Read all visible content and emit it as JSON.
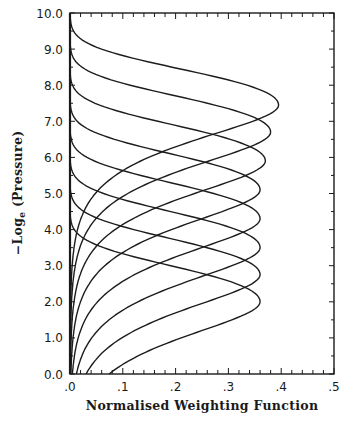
{
  "chart_data": {
    "type": "line",
    "title": "",
    "xlabel": "Normalised Weighting Function",
    "ylabel": "-Log_e (Pressure)",
    "ylabel_main": "−Log",
    "ylabel_sub": "e",
    "ylabel_rest": " (Pressure)",
    "xlim": [
      0.0,
      0.5
    ],
    "ylim": [
      0.0,
      10.0
    ],
    "x_ticks": [
      ".0",
      ".1",
      ".2",
      ".3",
      ".4",
      ".5"
    ],
    "y_ticks": [
      "0.0",
      "1.0",
      "2.0",
      "3.0",
      "4.0",
      "5.0",
      "6.0",
      "7.0",
      "8.0",
      "9.0",
      "10.0"
    ],
    "grid": false,
    "legend": null,
    "series": [
      {
        "name": "channel-1",
        "peak_y": 2.0,
        "peak_x": 0.36
      },
      {
        "name": "channel-2",
        "peak_y": 2.75,
        "peak_x": 0.36
      },
      {
        "name": "channel-3",
        "peak_y": 3.5,
        "peak_x": 0.36
      },
      {
        "name": "channel-4",
        "peak_y": 4.3,
        "peak_x": 0.36
      },
      {
        "name": "channel-5",
        "peak_y": 5.1,
        "peak_x": 0.36
      },
      {
        "name": "channel-6",
        "peak_y": 5.9,
        "peak_x": 0.37
      },
      {
        "name": "channel-7",
        "peak_y": 6.7,
        "peak_x": 0.38
      },
      {
        "name": "channel-8",
        "peak_y": 7.45,
        "peak_x": 0.395
      }
    ]
  }
}
